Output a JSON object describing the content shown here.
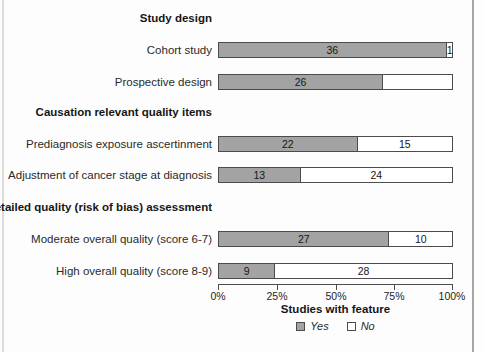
{
  "chart_data": {
    "type": "bar",
    "orientation": "horizontal",
    "stacked": true,
    "total_per_row": 37,
    "xlabel": "Studies with feature",
    "x_ticks": [
      "0%",
      "25%",
      "50%",
      "75%",
      "100%"
    ],
    "xlim_percent": [
      0,
      100
    ],
    "grid": false,
    "legend_position": "bottom-center",
    "legend": {
      "yes_label": "Yes",
      "no_label": "No"
    },
    "colors": {
      "yes_fill": "#a3a3a3",
      "no_fill": "#ffffff",
      "segment_border": "#4c4c4c"
    },
    "sections": [
      {
        "title": "Study design"
      },
      {
        "title": "Causation relevant quality items"
      },
      {
        "title": "Detailed quality (risk of bias) assessment"
      }
    ],
    "rows": [
      {
        "label": "Cohort study",
        "yes": 36,
        "no": 1,
        "yes_label": "36",
        "no_label": "1"
      },
      {
        "label": "Prospective design",
        "yes": 26,
        "yes_label": "26",
        "no_label": ""
      },
      {
        "label": "Prediagnosis exposure ascertinment",
        "yes": 22,
        "no": 15,
        "yes_label": "22",
        "no_label": "15"
      },
      {
        "label": "Adjustment of cancer stage at diagnosis",
        "yes": 13,
        "no": 24,
        "yes_label": "13",
        "no_label": "24"
      },
      {
        "label": "Moderate overall quality (score 6-7)",
        "yes": 27,
        "no": 10,
        "yes_label": "27",
        "no_label": "10"
      },
      {
        "label": "High overall quality (score 8-9)",
        "yes": 9,
        "no": 28,
        "yes_label": "9",
        "no_label": "28"
      }
    ]
  }
}
